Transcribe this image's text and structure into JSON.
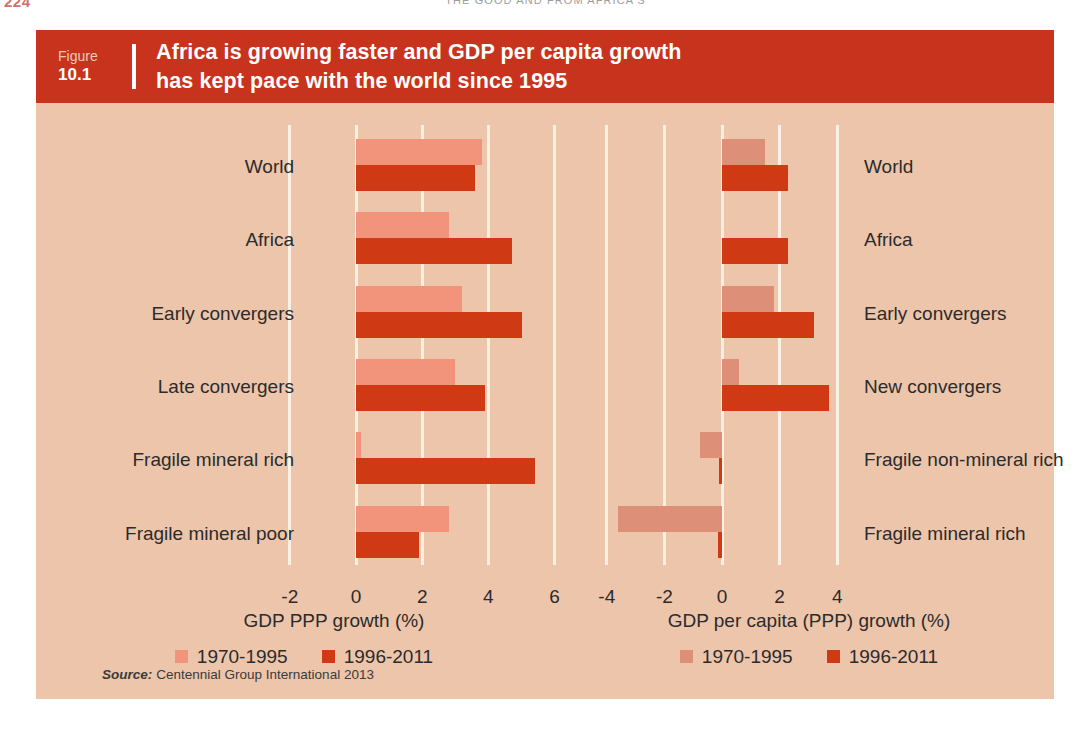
{
  "page_header": {
    "folio": "224",
    "running_head": "THE GOOD AND FROM AFRICA'S"
  },
  "figure": {
    "number_word": "Figure",
    "number": "10.1",
    "title_line1": "Africa is growing faster and GDP per capita growth",
    "title_line2": "has kept pace with the world since 1995",
    "source_label": "Source:",
    "source_text": "Centennial Group International 2013"
  },
  "chart_data": [
    {
      "type": "bar",
      "orientation": "horizontal",
      "id": "gdp-ppp-growth",
      "title": "",
      "xlabel": "GDP PPP growth (%)",
      "ylabel": "",
      "xlim": [
        -2,
        6
      ],
      "xticks": [
        -2,
        0,
        2,
        4,
        6
      ],
      "xtick_labels": [
        "-2",
        "0",
        "2",
        "4",
        "6"
      ],
      "grid": true,
      "legend_position": "bottom",
      "categories": [
        "World",
        "Africa",
        "Early convergers",
        "Late convergers",
        "Fragile mineral rich",
        "Fragile mineral poor"
      ],
      "series": [
        {
          "name": "1970-1995",
          "color": "#f2947c",
          "values": [
            3.8,
            2.8,
            3.2,
            3.0,
            0.15,
            2.8
          ]
        },
        {
          "name": "1996-2011",
          "color": "#cf3a15",
          "values": [
            3.6,
            4.7,
            5.0,
            3.9,
            5.4,
            1.9
          ]
        }
      ]
    },
    {
      "type": "bar",
      "orientation": "horizontal",
      "id": "gdp-per-capita-ppp-growth",
      "title": "",
      "xlabel": "GDP per capita (PPP) growth (%)",
      "ylabel": "",
      "xlim": [
        -4,
        4.6
      ],
      "xticks": [
        -4,
        -2,
        0,
        2,
        4
      ],
      "xtick_labels": [
        "-4",
        "-2",
        "0",
        "2",
        "4"
      ],
      "grid": true,
      "legend_position": "bottom",
      "categories": [
        "World",
        "Africa",
        "Early convergers",
        "New convergers",
        "Fragile non-mineral rich",
        "Fragile mineral rich"
      ],
      "series": [
        {
          "name": "1970-1995",
          "color": "#dd9077",
          "values": [
            1.5,
            0.0,
            1.8,
            0.6,
            -0.75,
            -3.6
          ]
        },
        {
          "name": "1996-2011",
          "color": "#cf3a15",
          "values": [
            2.3,
            2.3,
            3.2,
            3.7,
            -0.1,
            -0.15
          ]
        }
      ]
    }
  ]
}
